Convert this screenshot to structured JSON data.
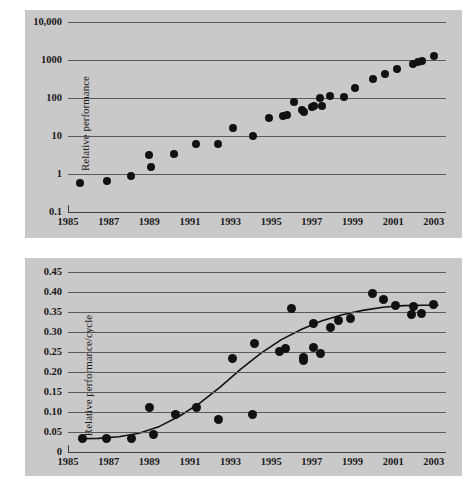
{
  "figure": {
    "background_color": "#ffffff",
    "panel_color": "#c9c9c9",
    "marker_color": "#111111",
    "gridline_color": "#5a5a5a"
  },
  "charts": [
    {
      "id": "top",
      "ylabel": "Relative performance",
      "yticks": [
        "10,000",
        "1000",
        "100",
        "10",
        "1",
        "0.1"
      ],
      "xticks": [
        "1985",
        "1987",
        "1989",
        "1991",
        "1993",
        "1995",
        "1997",
        "1999",
        "2001",
        "2003"
      ]
    },
    {
      "id": "bottom",
      "ylabel": "Relative performance/cycle",
      "yticks": [
        "0.45",
        "0.40",
        "0.35",
        "0.30",
        "0.25",
        "0.20",
        "0.15",
        "0.10",
        "0.05",
        "0"
      ],
      "xticks": [
        "1985",
        "1987",
        "1989",
        "1991",
        "1993",
        "1995",
        "1997",
        "1999",
        "2001",
        "2003"
      ]
    }
  ],
  "chart_data": [
    {
      "type": "scatter",
      "title": "",
      "xlabel": "",
      "ylabel": "Relative performance",
      "yscale": "log",
      "ylim": [
        0.1,
        10000
      ],
      "xlim": [
        1985,
        2003.6
      ],
      "grid": true,
      "legend": false,
      "ytick_values": [
        10000,
        1000,
        100,
        10,
        1,
        0.1
      ],
      "ytick_labels": [
        "10,000",
        "1000",
        "100",
        "10",
        "1",
        "0.1"
      ],
      "xtick_values": [
        1985,
        1987,
        1989,
        1991,
        1993,
        1995,
        1997,
        1999,
        2001,
        2003
      ],
      "xtick_labels": [
        "1985",
        "1987",
        "1989",
        "1991",
        "1993",
        "1995",
        "1997",
        "1999",
        "2001",
        "2003"
      ],
      "points": [
        {
          "x": 1985.6,
          "y": 0.58
        },
        {
          "x": 1986.9,
          "y": 0.66
        },
        {
          "x": 1988.1,
          "y": 0.88
        },
        {
          "x": 1989.0,
          "y": 3.1
        },
        {
          "x": 1989.1,
          "y": 1.5
        },
        {
          "x": 1990.2,
          "y": 3.3
        },
        {
          "x": 1991.3,
          "y": 6.2
        },
        {
          "x": 1992.4,
          "y": 6.0
        },
        {
          "x": 1993.1,
          "y": 16
        },
        {
          "x": 1994.1,
          "y": 10
        },
        {
          "x": 1994.9,
          "y": 30
        },
        {
          "x": 1995.6,
          "y": 33
        },
        {
          "x": 1995.8,
          "y": 36
        },
        {
          "x": 1996.1,
          "y": 78
        },
        {
          "x": 1996.5,
          "y": 48
        },
        {
          "x": 1996.6,
          "y": 43
        },
        {
          "x": 1997.0,
          "y": 57
        },
        {
          "x": 1997.1,
          "y": 62
        },
        {
          "x": 1997.4,
          "y": 100
        },
        {
          "x": 1997.5,
          "y": 62
        },
        {
          "x": 1997.9,
          "y": 113
        },
        {
          "x": 1998.6,
          "y": 108
        },
        {
          "x": 1999.1,
          "y": 180
        },
        {
          "x": 2000.0,
          "y": 310
        },
        {
          "x": 2000.6,
          "y": 420
        },
        {
          "x": 2001.2,
          "y": 580
        },
        {
          "x": 2002.0,
          "y": 780
        },
        {
          "x": 2002.2,
          "y": 900
        },
        {
          "x": 2002.4,
          "y": 950
        },
        {
          "x": 2003.0,
          "y": 1250
        }
      ]
    },
    {
      "type": "scatter",
      "title": "",
      "xlabel": "",
      "ylabel": "Relative performance/cycle",
      "yscale": "linear",
      "ylim": [
        0,
        0.45
      ],
      "xlim": [
        1985,
        2003.6
      ],
      "grid": true,
      "legend": false,
      "ytick_values": [
        0.45,
        0.4,
        0.35,
        0.3,
        0.25,
        0.2,
        0.15,
        0.1,
        0.05,
        0
      ],
      "ytick_labels": [
        "0.45",
        "0.40",
        "0.35",
        "0.30",
        "0.25",
        "0.20",
        "0.15",
        "0.10",
        "0.05",
        "0"
      ],
      "xtick_values": [
        1985,
        1987,
        1989,
        1991,
        1993,
        1995,
        1997,
        1999,
        2001,
        2003
      ],
      "xtick_labels": [
        "1985",
        "1987",
        "1989",
        "1991",
        "1993",
        "1995",
        "1997",
        "1999",
        "2001",
        "2003"
      ],
      "points": [
        {
          "x": 1985.7,
          "y": 0.033
        },
        {
          "x": 1986.9,
          "y": 0.034
        },
        {
          "x": 1988.1,
          "y": 0.033
        },
        {
          "x": 1989.0,
          "y": 0.111
        },
        {
          "x": 1989.2,
          "y": 0.045
        },
        {
          "x": 1990.3,
          "y": 0.093
        },
        {
          "x": 1991.3,
          "y": 0.111
        },
        {
          "x": 1992.4,
          "y": 0.082
        },
        {
          "x": 1993.1,
          "y": 0.233
        },
        {
          "x": 1994.1,
          "y": 0.093
        },
        {
          "x": 1994.2,
          "y": 0.272
        },
        {
          "x": 1995.4,
          "y": 0.252
        },
        {
          "x": 1995.7,
          "y": 0.259
        },
        {
          "x": 1996.0,
          "y": 0.36
        },
        {
          "x": 1996.6,
          "y": 0.236
        },
        {
          "x": 1996.6,
          "y": 0.23
        },
        {
          "x": 1997.1,
          "y": 0.262
        },
        {
          "x": 1997.1,
          "y": 0.321
        },
        {
          "x": 1997.4,
          "y": 0.247
        },
        {
          "x": 1997.9,
          "y": 0.312
        },
        {
          "x": 1998.3,
          "y": 0.329
        },
        {
          "x": 1998.9,
          "y": 0.333
        },
        {
          "x": 2000.0,
          "y": 0.396
        },
        {
          "x": 2000.5,
          "y": 0.381
        },
        {
          "x": 2001.1,
          "y": 0.367
        },
        {
          "x": 2001.9,
          "y": 0.345
        },
        {
          "x": 2002.0,
          "y": 0.364
        },
        {
          "x": 2002.4,
          "y": 0.347
        },
        {
          "x": 2003.0,
          "y": 0.368
        }
      ],
      "fit_curve": {
        "name": "sigmoid fit",
        "points": [
          {
            "x": 1985.6,
            "y": 0.033
          },
          {
            "x": 1986.5,
            "y": 0.034
          },
          {
            "x": 1987.5,
            "y": 0.038
          },
          {
            "x": 1988.5,
            "y": 0.047
          },
          {
            "x": 1989.5,
            "y": 0.064
          },
          {
            "x": 1990.5,
            "y": 0.09
          },
          {
            "x": 1991.5,
            "y": 0.123
          },
          {
            "x": 1992.5,
            "y": 0.163
          },
          {
            "x": 1993.5,
            "y": 0.207
          },
          {
            "x": 1994.5,
            "y": 0.247
          },
          {
            "x": 1995.5,
            "y": 0.281
          },
          {
            "x": 1996.5,
            "y": 0.307
          },
          {
            "x": 1997.5,
            "y": 0.328
          },
          {
            "x": 1998.5,
            "y": 0.343
          },
          {
            "x": 1999.5,
            "y": 0.354
          },
          {
            "x": 2000.5,
            "y": 0.362
          },
          {
            "x": 2001.5,
            "y": 0.366
          },
          {
            "x": 2002.5,
            "y": 0.367
          },
          {
            "x": 2003.2,
            "y": 0.367
          }
        ]
      }
    }
  ]
}
